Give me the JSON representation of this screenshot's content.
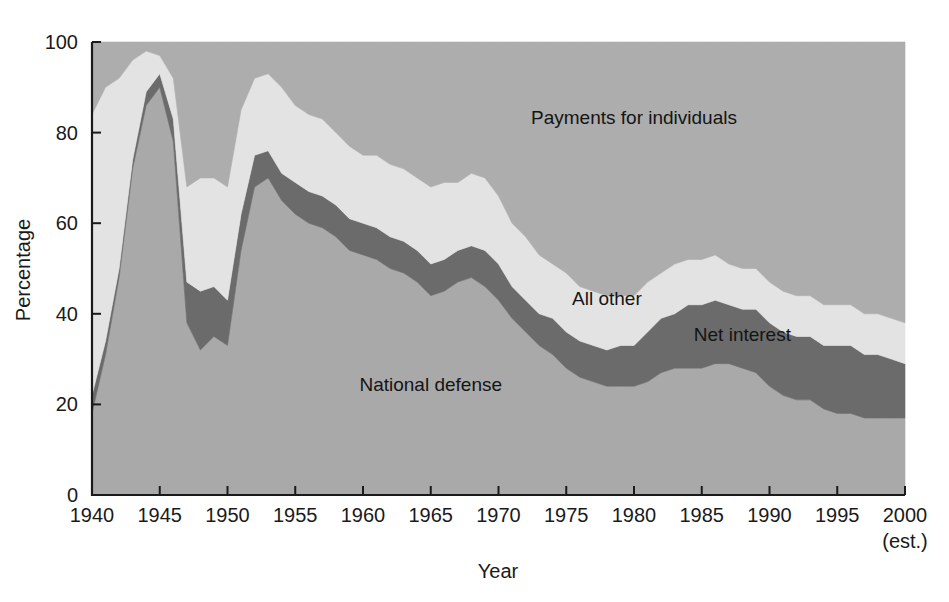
{
  "chart_data": {
    "type": "area",
    "stacked": true,
    "title": "",
    "xlabel": "Year",
    "ylabel": "Percentage",
    "xlim": [
      1940,
      2000
    ],
    "ylim": [
      0,
      100
    ],
    "grid": false,
    "legend_position": "inline-annotations",
    "x_tick_labels": [
      "1940",
      "1945",
      "1950",
      "1955",
      "1960",
      "1965",
      "1970",
      "1975",
      "1980",
      "1985",
      "1990",
      "1995",
      "2000"
    ],
    "x_tick_values": [
      1940,
      1945,
      1950,
      1955,
      1960,
      1965,
      1970,
      1975,
      1980,
      1985,
      1990,
      1995,
      2000
    ],
    "x_tick_note": "(est.)",
    "y_tick_labels": [
      "0",
      "20",
      "40",
      "60",
      "80",
      "100"
    ],
    "y_tick_values": [
      0,
      20,
      40,
      60,
      80,
      100
    ],
    "x": [
      1940,
      1941,
      1942,
      1943,
      1944,
      1945,
      1946,
      1947,
      1948,
      1949,
      1950,
      1951,
      1952,
      1953,
      1954,
      1955,
      1956,
      1957,
      1958,
      1959,
      1960,
      1961,
      1962,
      1963,
      1964,
      1965,
      1966,
      1967,
      1968,
      1969,
      1970,
      1971,
      1972,
      1973,
      1974,
      1975,
      1976,
      1977,
      1978,
      1979,
      1980,
      1981,
      1982,
      1983,
      1984,
      1985,
      1986,
      1987,
      1988,
      1989,
      1990,
      1991,
      1992,
      1993,
      1994,
      1995,
      1996,
      1997,
      1998,
      1999,
      2000
    ],
    "series": [
      {
        "name": "National defense",
        "color": "#a9a9a9",
        "label_x": 1965,
        "label_y": 23,
        "values": [
          18,
          31,
          48,
          72,
          86,
          90,
          78,
          38,
          32,
          35,
          33,
          54,
          68,
          70,
          65,
          62,
          60,
          59,
          57,
          54,
          53,
          52,
          50,
          49,
          47,
          44,
          45,
          47,
          48,
          46,
          43,
          39,
          36,
          33,
          31,
          28,
          26,
          25,
          24,
          24,
          24,
          25,
          27,
          28,
          28,
          28,
          29,
          29,
          28,
          27,
          24,
          22,
          21,
          21,
          19,
          18,
          18,
          17,
          17,
          17,
          17
        ]
      },
      {
        "name": "Net interest",
        "color": "#6b6b6b",
        "label_x": 1988,
        "label_y": 34,
        "values": [
          4,
          3,
          2,
          2,
          3,
          3,
          5,
          9,
          13,
          11,
          10,
          8,
          7,
          6,
          6,
          7,
          7,
          7,
          7,
          7,
          7,
          7,
          7,
          7,
          7,
          7,
          7,
          7,
          7,
          8,
          8,
          7,
          7,
          7,
          8,
          8,
          8,
          8,
          8,
          9,
          9,
          11,
          12,
          12,
          14,
          14,
          14,
          13,
          13,
          14,
          14,
          14,
          14,
          14,
          14,
          15,
          15,
          14,
          14,
          13,
          12
        ]
      },
      {
        "name": "All other",
        "color": "#e3e3e3",
        "label_x": 1978,
        "label_y": 42,
        "values": [
          62,
          56,
          42,
          22,
          9,
          4,
          9,
          21,
          25,
          24,
          25,
          23,
          17,
          17,
          19,
          17,
          17,
          17,
          16,
          16,
          15,
          16,
          16,
          16,
          16,
          17,
          17,
          15,
          16,
          16,
          15,
          14,
          14,
          13,
          12,
          13,
          12,
          12,
          12,
          11,
          11,
          11,
          10,
          11,
          10,
          10,
          10,
          9,
          9,
          9,
          9,
          9,
          9,
          9,
          9,
          9,
          9,
          9,
          9,
          9,
          9
        ]
      },
      {
        "name": "Payments for individuals",
        "color": "#adadad",
        "label_x": 1980,
        "label_y": 82,
        "values": [
          16,
          10,
          8,
          4,
          2,
          3,
          8,
          32,
          30,
          30,
          32,
          15,
          8,
          7,
          10,
          14,
          16,
          17,
          20,
          23,
          25,
          25,
          27,
          28,
          30,
          32,
          31,
          31,
          29,
          30,
          34,
          40,
          43,
          47,
          49,
          51,
          54,
          55,
          56,
          56,
          56,
          53,
          51,
          49,
          48,
          48,
          47,
          49,
          50,
          50,
          53,
          55,
          56,
          56,
          58,
          58,
          58,
          60,
          60,
          61,
          62
        ]
      }
    ],
    "annotations": [
      {
        "text": "Payments for individuals",
        "x": 1980,
        "y": 82
      },
      {
        "text": "All other",
        "x": 1978,
        "y": 42
      },
      {
        "text": "Net interest",
        "x": 1988,
        "y": 34
      },
      {
        "text": "National defense",
        "x": 1965,
        "y": 23
      }
    ]
  },
  "colors": {
    "defense": "#a9a9a9",
    "net_interest": "#6b6b6b",
    "all_other": "#e3e3e3",
    "payments": "#adadad",
    "axis": "#1a1a1a",
    "background": "#ffffff"
  }
}
